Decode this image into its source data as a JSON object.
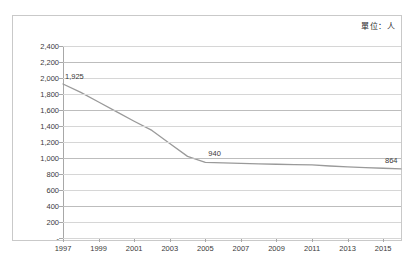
{
  "chart_data": {
    "type": "line",
    "title": "",
    "subtitle": "",
    "unit_note": "單位：人",
    "xlabel": "",
    "ylabel": "",
    "xlim": [
      1997,
      2016
    ],
    "ylim": [
      0,
      2400
    ],
    "grid": true,
    "legend": "none",
    "x_tick_labels": [
      "1997",
      "1999",
      "2001",
      "2003",
      "2005",
      "2007",
      "2009",
      "2011",
      "2013",
      "2015"
    ],
    "x_tick_values": [
      1997,
      1999,
      2001,
      2003,
      2005,
      2007,
      2009,
      2011,
      2013,
      2015
    ],
    "y_tick_labels": [
      "2,400",
      "2,200",
      "2,000",
      "1,800",
      "1,600",
      "1,400",
      "1,200",
      "1,000",
      "800",
      "600",
      "400",
      "200",
      "-"
    ],
    "y_tick_values": [
      2400,
      2200,
      2000,
      1800,
      1600,
      1400,
      1200,
      1000,
      800,
      600,
      400,
      200,
      0
    ],
    "series": [
      {
        "name": "",
        "color": "#9a9a9a",
        "x": [
          1997,
          1998,
          1999,
          2000,
          2001,
          2002,
          2003,
          2004,
          2005,
          2006,
          2007,
          2008,
          2009,
          2010,
          2011,
          2012,
          2013,
          2014,
          2015,
          2016
        ],
        "values": [
          1925,
          1820,
          1700,
          1580,
          1460,
          1345,
          1180,
          1020,
          945,
          940,
          932,
          927,
          922,
          918,
          915,
          900,
          888,
          880,
          872,
          864
        ]
      }
    ],
    "annotations": [
      {
        "label": "1,925",
        "x": 1997,
        "y": 1925
      },
      {
        "label": "940",
        "x": 2005,
        "y": 940
      },
      {
        "label": "864",
        "x": 2016,
        "y": 864
      }
    ]
  }
}
